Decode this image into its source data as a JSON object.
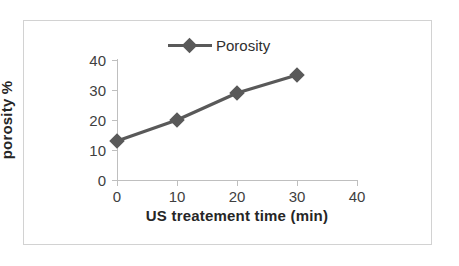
{
  "chart_data": {
    "type": "line",
    "title": "",
    "subtitle": "",
    "xlabel": "US treatement time (min)",
    "ylabel": "porosity %",
    "xlim": [
      0,
      40
    ],
    "ylim": [
      0,
      40
    ],
    "xticks": [
      "0",
      "10",
      "20",
      "30",
      "40"
    ],
    "yticks": [
      "0",
      "10",
      "20",
      "30",
      "40"
    ],
    "xtick_values": [
      0,
      10,
      20,
      30,
      40
    ],
    "ytick_values": [
      0,
      10,
      20,
      30,
      40
    ],
    "grid": false,
    "legend_position": "top-center",
    "legend": [
      "Porosity"
    ],
    "x": [
      0,
      10,
      20,
      30
    ],
    "series": [
      {
        "name": "Porosity",
        "values": [
          13,
          20,
          29,
          35
        ],
        "color": "#595959",
        "marker": "diamond"
      }
    ],
    "annotations": []
  },
  "style": {
    "series_color": "#595959",
    "axis_color": "#bfbfbf",
    "tick_text_color": "#3f3f3f",
    "axis_title_color": "#262626",
    "frame_color": "#d2d2d2",
    "background": "#ffffff"
  },
  "legend": {
    "entries": [
      {
        "label": "Porosity",
        "marker_name": "diamond-marker"
      }
    ]
  },
  "axes": {
    "x": {
      "title": "US treatement time (min)",
      "ticks": [
        {
          "label": "0"
        },
        {
          "label": "10"
        },
        {
          "label": "20"
        },
        {
          "label": "30"
        },
        {
          "label": "40"
        }
      ]
    },
    "y": {
      "title": "porosity %",
      "ticks": [
        {
          "label": "0"
        },
        {
          "label": "10"
        },
        {
          "label": "20"
        },
        {
          "label": "30"
        },
        {
          "label": "40"
        }
      ]
    }
  },
  "points": [
    {
      "x": "0",
      "y": "13"
    },
    {
      "x": "10",
      "y": "20"
    },
    {
      "x": "20",
      "y": "29"
    },
    {
      "x": "30",
      "y": "35"
    }
  ]
}
